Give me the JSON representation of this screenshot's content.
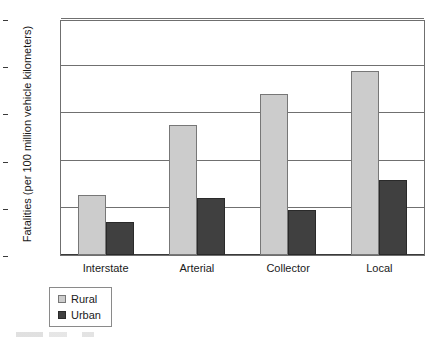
{
  "chart_data": {
    "type": "bar",
    "title": "",
    "xlabel": "",
    "ylabel": "Fatalities (per 100 million vehicle kilometers)",
    "categories": [
      "Interstate",
      "Arterial",
      "Collector",
      "Local"
    ],
    "series": [
      {
        "name": "Rural",
        "color": "#cccccc",
        "values": [
          0.64,
          1.38,
          1.71,
          1.95
        ]
      },
      {
        "name": "Urban",
        "color": "#404040",
        "values": [
          0.35,
          0.6,
          0.48,
          0.79
        ]
      }
    ],
    "ylim": [
      0,
      2.5
    ],
    "yticks": [
      "0",
      "0.5",
      "1",
      "1.5",
      "2",
      "2.5"
    ],
    "ytick_values": [
      0,
      0.5,
      1,
      1.5,
      2,
      2.5
    ],
    "grid": true,
    "legend_position": "bottom-left"
  },
  "legend": {
    "items": [
      {
        "label": "Rural",
        "color": "#cccccc"
      },
      {
        "label": "Urban",
        "color": "#404040"
      }
    ]
  }
}
